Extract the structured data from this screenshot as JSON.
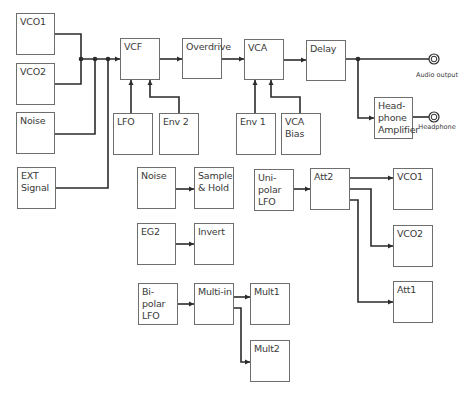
{
  "diagram": {
    "type": "synth-signal-flow",
    "blocks": [
      {
        "id": "vco1",
        "label": "VCO1",
        "x": 16,
        "y": 13,
        "w": 39,
        "h": 42
      },
      {
        "id": "vco2",
        "label": "VCO2",
        "x": 16,
        "y": 63,
        "w": 39,
        "h": 42
      },
      {
        "id": "noise",
        "label": "Noise",
        "x": 16,
        "y": 112,
        "w": 39,
        "h": 42
      },
      {
        "id": "ext-signal",
        "label": "EXT\nSignal",
        "x": 17,
        "y": 167,
        "w": 39,
        "h": 42
      },
      {
        "id": "vcf",
        "label": "VCF",
        "x": 120,
        "y": 38,
        "w": 40,
        "h": 42
      },
      {
        "id": "overdrive",
        "label": "Overdrive",
        "x": 182,
        "y": 38,
        "w": 40,
        "h": 41
      },
      {
        "id": "vca",
        "label": "VCA",
        "x": 244,
        "y": 39,
        "w": 40,
        "h": 41
      },
      {
        "id": "delay",
        "label": "Delay",
        "x": 306,
        "y": 40,
        "w": 40,
        "h": 41
      },
      {
        "id": "lfo",
        "label": "LFO",
        "x": 113,
        "y": 113,
        "w": 40,
        "h": 42
      },
      {
        "id": "env2",
        "label": "Env 2",
        "x": 159,
        "y": 113,
        "w": 40,
        "h": 42
      },
      {
        "id": "env1",
        "label": "Env 1",
        "x": 236,
        "y": 113,
        "w": 40,
        "h": 42
      },
      {
        "id": "vca-bias",
        "label": "VCA\nBias",
        "x": 281,
        "y": 113,
        "w": 40,
        "h": 42
      },
      {
        "id": "headphone-amp",
        "label": "Head-\nphone\nAmplifier",
        "x": 374,
        "y": 97,
        "w": 39,
        "h": 42
      },
      {
        "id": "noise-2",
        "label": "Noise",
        "x": 137,
        "y": 167,
        "w": 39,
        "h": 42
      },
      {
        "id": "sample-hold",
        "label": "Sample\n& Hold",
        "x": 194,
        "y": 167,
        "w": 40,
        "h": 42
      },
      {
        "id": "eg2",
        "label": "EG2",
        "x": 137,
        "y": 223,
        "w": 39,
        "h": 42
      },
      {
        "id": "invert",
        "label": "Invert",
        "x": 194,
        "y": 223,
        "w": 40,
        "h": 42
      },
      {
        "id": "unipolar-lfo",
        "label": "Uni-polar\nLFO",
        "x": 254,
        "y": 169,
        "w": 40,
        "h": 42
      },
      {
        "id": "att2",
        "label": "Att2",
        "x": 310,
        "y": 168,
        "w": 40,
        "h": 42
      },
      {
        "id": "vco1-dest",
        "label": "VCO1",
        "x": 393,
        "y": 168,
        "w": 40,
        "h": 42
      },
      {
        "id": "vco2-dest",
        "label": "VCO2",
        "x": 393,
        "y": 225,
        "w": 40,
        "h": 42
      },
      {
        "id": "att1",
        "label": "Att1",
        "x": 393,
        "y": 281,
        "w": 40,
        "h": 42
      },
      {
        "id": "bipolar-lfo",
        "label": "Bi-polar\nLFO",
        "x": 138,
        "y": 283,
        "w": 40,
        "h": 42
      },
      {
        "id": "multi-in",
        "label": "Multi-in",
        "x": 194,
        "y": 283,
        "w": 40,
        "h": 42
      },
      {
        "id": "mult1",
        "label": "Mult1",
        "x": 250,
        "y": 283,
        "w": 40,
        "h": 42
      },
      {
        "id": "mult2",
        "label": "Mult2",
        "x": 250,
        "y": 340,
        "w": 40,
        "h": 42
      }
    ],
    "jacks": [
      {
        "id": "audio-output",
        "label": "Audio output",
        "cx": 434,
        "cy": 59,
        "label_x": 437,
        "label_y": 71
      },
      {
        "id": "headphone",
        "label": "Headphone",
        "cx": 434,
        "cy": 117,
        "label_x": 437,
        "label_y": 123
      }
    ],
    "connections": [
      {
        "from": "vco1",
        "to": "vcf"
      },
      {
        "from": "vco2",
        "to": "vcf"
      },
      {
        "from": "noise",
        "to": "vcf"
      },
      {
        "from": "ext-signal",
        "to": "vcf"
      },
      {
        "from": "vcf",
        "to": "overdrive"
      },
      {
        "from": "overdrive",
        "to": "vca"
      },
      {
        "from": "vca",
        "to": "delay"
      },
      {
        "from": "lfo",
        "to": "vcf"
      },
      {
        "from": "env2",
        "to": "vcf"
      },
      {
        "from": "env1",
        "to": "vca"
      },
      {
        "from": "vca-bias",
        "to": "vca"
      },
      {
        "from": "delay",
        "to": "audio-output"
      },
      {
        "from": "delay",
        "to": "headphone-amp"
      },
      {
        "from": "headphone-amp",
        "to": "headphone"
      },
      {
        "from": "noise-2",
        "to": "sample-hold"
      },
      {
        "from": "eg2",
        "to": "invert"
      },
      {
        "from": "unipolar-lfo",
        "to": "att2"
      },
      {
        "from": "att2",
        "to": "vco1-dest"
      },
      {
        "from": "att2",
        "to": "vco2-dest"
      },
      {
        "from": "att2",
        "to": "att1"
      },
      {
        "from": "bipolar-lfo",
        "to": "multi-in"
      },
      {
        "from": "multi-in",
        "to": "mult1"
      },
      {
        "from": "multi-in",
        "to": "mult2"
      }
    ],
    "colors": {
      "line": "#2b2b2b",
      "box_border": "#6e6e6e",
      "text": "#3a3a3a",
      "background": "#ffffff"
    }
  }
}
